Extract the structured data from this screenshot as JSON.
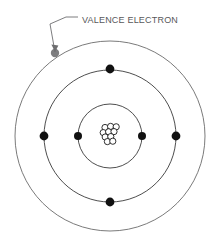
{
  "diagram": {
    "type": "bohr-atomic-model",
    "background_color": "#ffffff",
    "center": {
      "x": 110,
      "y": 136
    },
    "callout": {
      "label": "VALENCE ELECTRON",
      "text_x": 62,
      "text_y": 21,
      "font_size": 9,
      "color": "#58585a",
      "leader": {
        "points": "78,17 66,17 50,24 55,52",
        "color": "#6e6e70",
        "width": 0.9,
        "arrow": {
          "x": 55,
          "y": 50,
          "color": "#6e6e70"
        }
      }
    },
    "nucleus": {
      "label": "nucleus",
      "outline_color": "#1a1a1a",
      "fill_color": "#ffffff",
      "particle_radius": 3.1,
      "particles": [
        {
          "x": 105.0,
          "y": 127.5
        },
        {
          "x": 110.6,
          "y": 126.4
        },
        {
          "x": 116.2,
          "y": 126.8
        },
        {
          "x": 103.2,
          "y": 132.6
        },
        {
          "x": 108.6,
          "y": 131.8
        },
        {
          "x": 114.0,
          "y": 131.6
        },
        {
          "x": 105.2,
          "y": 137.0
        },
        {
          "x": 110.8,
          "y": 136.6
        },
        {
          "x": 107.4,
          "y": 141.6
        },
        {
          "x": 112.8,
          "y": 141.2
        }
      ]
    },
    "shells": [
      {
        "name": "shell-1",
        "radius": 32,
        "stroke_color": "#3a3a3a",
        "stroke_width": 0.9,
        "electron_count": 2,
        "electrons": [
          {
            "name": "electron-shell1-left",
            "x": 78,
            "y": 136,
            "r": 4.0,
            "color": "#111111",
            "valence": false
          },
          {
            "name": "electron-shell1-right",
            "x": 142,
            "y": 136,
            "r": 4.0,
            "color": "#111111",
            "valence": false
          }
        ]
      },
      {
        "name": "shell-2",
        "radius": 66,
        "stroke_color": "#3a3a3a",
        "stroke_width": 0.9,
        "electron_count": 4,
        "electrons": [
          {
            "name": "electron-shell2-top",
            "x": 110,
            "y": 69,
            "r": 4.4,
            "color": "#111111",
            "valence": false
          },
          {
            "name": "electron-shell2-left",
            "x": 44,
            "y": 136,
            "r": 4.4,
            "color": "#111111",
            "valence": false
          },
          {
            "name": "electron-shell2-right",
            "x": 176,
            "y": 136,
            "r": 4.4,
            "color": "#111111",
            "valence": false
          },
          {
            "name": "electron-shell2-bottom",
            "x": 110,
            "y": 202,
            "r": 4.4,
            "color": "#111111",
            "valence": false
          }
        ]
      },
      {
        "name": "shell-3",
        "radius": 95,
        "stroke_color": "#6b6b6b",
        "stroke_width": 0.9,
        "electron_count": 1,
        "electrons": [
          {
            "name": "electron-valence",
            "x": 55,
            "y": 53,
            "r": 4.2,
            "color": "#7d7d7f",
            "valence": true
          }
        ]
      }
    ]
  }
}
